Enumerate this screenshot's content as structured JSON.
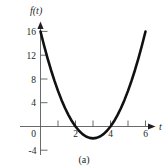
{
  "figure": {
    "caption": "(a)",
    "background_color": "#ffffff",
    "curve_color": "#111111",
    "axis_color": "#58595b",
    "text_color": "#231f20"
  },
  "chart_data": {
    "type": "line",
    "title": "",
    "subtitle": "",
    "xlabel": "t",
    "ylabel": "f(t)",
    "xlim": [
      -0.55,
      6.85
    ],
    "ylim": [
      -5.2,
      17.6
    ],
    "xticks": [
      1,
      2,
      3,
      4,
      5,
      6
    ],
    "xtick_labels": [
      "",
      "2",
      "",
      "4",
      "",
      "6"
    ],
    "yticks": [
      -4,
      0,
      4,
      8,
      12,
      16
    ],
    "ytick_labels": [
      "-4",
      "0",
      "4",
      "8",
      "12",
      "16"
    ],
    "grid": false,
    "legend": null,
    "annotations": [],
    "series": [
      {
        "name": "f(t)",
        "equation": "f(t) = 2t^2 - 12t + 16",
        "vertex": [
          3,
          -2
        ],
        "roots": [
          2,
          4
        ],
        "x": [
          0.0,
          0.2,
          0.4,
          0.6,
          0.8,
          1.0,
          1.2,
          1.4,
          1.6,
          1.8,
          2.0,
          2.2,
          2.4,
          2.6,
          2.8,
          3.0,
          3.2,
          3.4,
          3.6,
          3.8,
          4.0,
          4.2,
          4.4,
          4.6,
          4.8,
          5.0,
          5.2,
          5.4,
          5.6,
          5.8,
          6.0
        ],
        "y": [
          16.0,
          13.68,
          11.52,
          9.52,
          7.68,
          6.0,
          4.48,
          3.12,
          1.92,
          0.88,
          0.0,
          -0.72,
          -1.28,
          -1.68,
          -1.92,
          -2.0,
          -1.92,
          -1.68,
          -1.28,
          -0.72,
          0.0,
          0.88,
          1.92,
          3.12,
          4.48,
          6.0,
          7.68,
          9.52,
          11.52,
          13.68,
          16.0
        ]
      }
    ]
  }
}
